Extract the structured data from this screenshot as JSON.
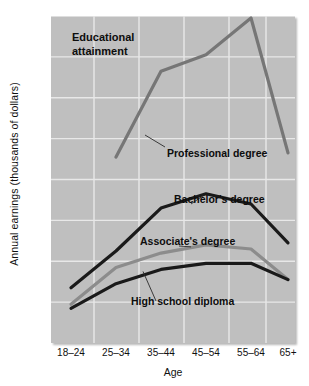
{
  "chart_data": {
    "type": "line",
    "title": "Educational attainment",
    "xlabel": "Age",
    "ylabel": "Annual earnings (thousands of dollars)",
    "categories": [
      "18–24",
      "25–34",
      "35–44",
      "45–54",
      "55–64",
      "65+"
    ],
    "ylim": [
      0,
      160
    ],
    "yticks": [
      0,
      20,
      40,
      60,
      80,
      100,
      120,
      140,
      160
    ],
    "ytick_labels": [
      "0",
      "20",
      "40",
      "60",
      "80",
      "100",
      "120",
      "140",
      "160"
    ],
    "grid": true,
    "legend": "none (series labeled inline with leader lines)",
    "series": [
      {
        "name": "Professional degree",
        "color": "#767676",
        "values": [
          null,
          91,
          133,
          141,
          159,
          93
        ],
        "label_text": "Professional degree"
      },
      {
        "name": "Bachelor's degree",
        "color": "#1a1a1a",
        "values": [
          27,
          45,
          66,
          73,
          68,
          49
        ],
        "label_text": "Bachelor's degree"
      },
      {
        "name": "Associate's degree",
        "color": "#8c8c8c",
        "values": [
          19,
          37,
          44,
          48,
          46,
          31
        ],
        "label_text": "Associate's degree"
      },
      {
        "name": "High school diploma",
        "color": "#1a1a1a",
        "values": [
          17,
          29,
          36,
          39,
          39,
          31
        ],
        "label_text": "High school diploma"
      }
    ],
    "annotations": [
      {
        "text": "Professional degree",
        "attached_to": "Professional degree"
      },
      {
        "text": "Bachelor's degree",
        "attached_to": "Bachelor's degree"
      },
      {
        "text": "Associate's degree",
        "attached_to": "Associate's degree"
      },
      {
        "text": "High school diploma",
        "attached_to": "High school diploma"
      }
    ],
    "plot_background": "#bfbfbf",
    "gridline_color": "#e8e8e8"
  }
}
